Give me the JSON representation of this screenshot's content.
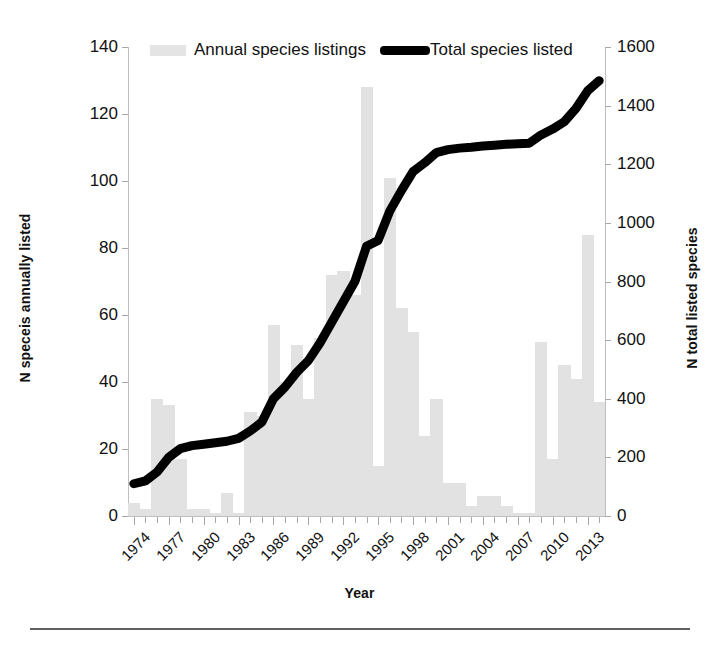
{
  "legend": {
    "position": "top-center",
    "items": [
      {
        "label": "Annual species listings",
        "marker": "bar-swatch",
        "color": "#e4e4e4"
      },
      {
        "label": "Total species listed",
        "marker": "line-swatch",
        "color": "#000000"
      }
    ]
  },
  "axes": {
    "xlabel": "Year",
    "ylabel_left": "N speceis annually listed",
    "ylabel_right": "N total listed species",
    "y_left_ticks": [
      "0",
      "20",
      "40",
      "60",
      "80",
      "100",
      "120",
      "140"
    ],
    "y_right_ticks": [
      "0",
      "200",
      "400",
      "600",
      "800",
      "1000",
      "1200",
      "1400",
      "1600"
    ],
    "x_ticks": [
      "1974",
      "1977",
      "1980",
      "1983",
      "1986",
      "1989",
      "1992",
      "1995",
      "1998",
      "2001",
      "2004",
      "2007",
      "2010",
      "2013"
    ]
  },
  "chart_data": {
    "type": "bar",
    "title": "",
    "xlabel": "Year",
    "ylabel": "N speceis annually listed",
    "ylabel_secondary": "N total listed species",
    "ylim": [
      0,
      140
    ],
    "ylim_secondary": [
      0,
      1600
    ],
    "grid": false,
    "legend_position": "top-center",
    "categories": [
      "1974",
      "1975",
      "1976",
      "1977",
      "1978",
      "1979",
      "1980",
      "1981",
      "1982",
      "1983",
      "1984",
      "1985",
      "1986",
      "1987",
      "1988",
      "1989",
      "1990",
      "1991",
      "1992",
      "1993",
      "1994",
      "1995",
      "1996",
      "1997",
      "1998",
      "1999",
      "2000",
      "2001",
      "2002",
      "2003",
      "2004",
      "2005",
      "2006",
      "2007",
      "2008",
      "2009",
      "2010",
      "2011",
      "2012",
      "2013",
      "2014"
    ],
    "series": [
      {
        "name": "Annual species listings",
        "type": "bar",
        "axis": "left",
        "color": "#e2e2e2",
        "units": "species per year",
        "values": [
          4,
          2,
          35,
          33,
          17,
          2,
          2,
          1,
          7,
          1,
          31,
          30,
          57,
          40,
          51,
          35,
          53,
          72,
          73,
          66,
          128,
          15,
          101,
          62,
          55,
          24,
          35,
          10,
          10,
          3,
          6,
          6,
          3,
          1,
          1,
          52,
          17,
          45,
          41,
          84,
          34
        ]
      },
      {
        "name": "Total species listed",
        "type": "line",
        "axis": "right",
        "color": "#000000",
        "units": "cumulative species",
        "values": [
          110,
          120,
          150,
          200,
          230,
          240,
          245,
          250,
          255,
          265,
          290,
          320,
          400,
          440,
          490,
          530,
          590,
          660,
          730,
          800,
          920,
          940,
          1040,
          1110,
          1175,
          1205,
          1240,
          1250,
          1255,
          1258,
          1262,
          1265,
          1268,
          1270,
          1272,
          1300,
          1320,
          1345,
          1390,
          1450,
          1485
        ]
      }
    ]
  }
}
